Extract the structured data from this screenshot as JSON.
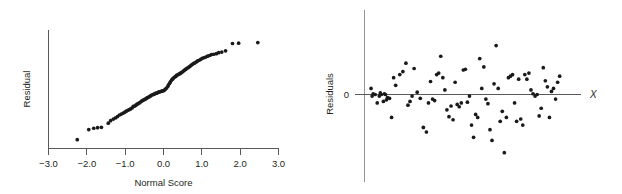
{
  "figure": {
    "panels": [
      {
        "id": "normal-probability-plot",
        "ylabel": "Residual",
        "xlabel": "Normal Score",
        "xticks": [
          "−3.0",
          "−2.0",
          "−1.0",
          "0.0",
          "1.0",
          "2.0",
          "3.0"
        ],
        "yticks": []
      },
      {
        "id": "residual-plot",
        "ylabel": "Residuals",
        "xlabel": "X",
        "xticks": [],
        "yticks": [
          "0"
        ]
      }
    ]
  },
  "chart_data": [
    {
      "type": "scatter",
      "id": "normal-probability-plot",
      "title": "",
      "xlabel": "Normal Score",
      "ylabel": "Residual",
      "xlim": [
        -3.0,
        3.0
      ],
      "ylim": [
        -1.0,
        1.0
      ],
      "xticks": [
        -3.0,
        -2.0,
        -1.0,
        0.0,
        1.0,
        2.0,
        3.0
      ],
      "xticklabels": [
        "−3.0",
        "−2.0",
        "−1.0",
        "0.0",
        "1.0",
        "2.0",
        "3.0"
      ],
      "yticks": [],
      "grid": false,
      "legend": null,
      "series": [
        {
          "name": "residual quantiles",
          "x": [
            -2.25,
            -1.95,
            -1.82,
            -1.72,
            -1.62,
            -1.44,
            -1.38,
            -1.31,
            -1.25,
            -1.2,
            -1.15,
            -1.1,
            -1.05,
            -1.01,
            -0.97,
            -0.93,
            -0.89,
            -0.86,
            -0.82,
            -0.79,
            -0.75,
            -0.72,
            -0.69,
            -0.66,
            -0.63,
            -0.6,
            -0.57,
            -0.54,
            -0.51,
            -0.48,
            -0.45,
            -0.43,
            -0.4,
            -0.37,
            -0.34,
            -0.32,
            -0.29,
            -0.26,
            -0.24,
            -0.21,
            -0.18,
            -0.16,
            -0.13,
            -0.11,
            -0.08,
            -0.05,
            -0.03,
            0.0,
            0.03,
            0.05,
            0.08,
            0.11,
            0.13,
            0.16,
            0.18,
            0.21,
            0.24,
            0.26,
            0.29,
            0.32,
            0.34,
            0.37,
            0.4,
            0.43,
            0.45,
            0.48,
            0.51,
            0.54,
            0.57,
            0.6,
            0.63,
            0.66,
            0.69,
            0.72,
            0.75,
            0.79,
            0.82,
            0.86,
            0.89,
            0.93,
            0.97,
            1.01,
            1.05,
            1.1,
            1.15,
            1.2,
            1.25,
            1.31,
            1.38,
            1.44,
            1.52,
            1.62,
            1.8,
            1.96,
            2.46
          ],
          "y": [
            -0.86,
            -0.7,
            -0.68,
            -0.67,
            -0.665,
            -0.6,
            -0.56,
            -0.535,
            -0.515,
            -0.495,
            -0.47,
            -0.455,
            -0.44,
            -0.425,
            -0.41,
            -0.395,
            -0.385,
            -0.375,
            -0.36,
            -0.335,
            -0.33,
            -0.315,
            -0.3,
            -0.29,
            -0.28,
            -0.265,
            -0.25,
            -0.24,
            -0.23,
            -0.22,
            -0.21,
            -0.2,
            -0.19,
            -0.18,
            -0.17,
            -0.16,
            -0.15,
            -0.145,
            -0.14,
            -0.13,
            -0.125,
            -0.12,
            -0.11,
            -0.105,
            -0.1,
            -0.095,
            -0.09,
            -0.085,
            -0.075,
            -0.06,
            -0.045,
            -0.02,
            0.005,
            0.03,
            0.055,
            0.08,
            0.1,
            0.115,
            0.13,
            0.14,
            0.155,
            0.165,
            0.175,
            0.185,
            0.195,
            0.205,
            0.22,
            0.235,
            0.25,
            0.26,
            0.275,
            0.285,
            0.3,
            0.315,
            0.33,
            0.345,
            0.355,
            0.37,
            0.385,
            0.395,
            0.41,
            0.425,
            0.435,
            0.445,
            0.46,
            0.47,
            0.485,
            0.49,
            0.5,
            0.515,
            0.525,
            0.545,
            0.66,
            0.665,
            0.675
          ]
        }
      ]
    },
    {
      "type": "scatter",
      "id": "residual-plot",
      "title": "",
      "xlabel": "X",
      "ylabel": "Residuals",
      "xlim": [
        0,
        100
      ],
      "ylim": [
        -1.0,
        1.0
      ],
      "xticks": [],
      "yticks": [
        0
      ],
      "yticklabels": [
        "0"
      ],
      "grid": false,
      "legend": null,
      "reference_line": 0,
      "series": [
        {
          "name": "residuals vs X",
          "x": [
            1.5,
            2.0,
            2.5,
            3.5,
            4.5,
            5.5,
            6.0,
            6.5,
            7.5,
            8.0,
            8.5,
            9.0,
            9.5,
            10.5,
            11.5,
            12.5,
            13.5,
            15.5,
            17.0,
            18.5,
            19.5,
            20.5,
            21.5,
            22.5,
            24.0,
            25.5,
            27.0,
            28.5,
            29.5,
            30.5,
            31.5,
            32.5,
            33.5,
            34.5,
            35.5,
            36.5,
            37.5,
            38.5,
            39.5,
            40.5,
            41.5,
            42.5,
            43.5,
            44.5,
            45.5,
            46.5,
            47.5,
            48.5,
            49.5,
            50.5,
            51.5,
            52.5,
            53.5,
            54.5,
            55.5,
            56.5,
            57.5,
            58.5,
            59.5,
            60.5,
            61.5,
            62.5,
            63.5,
            64.5,
            65.5,
            66.5,
            67.5,
            68.5,
            69.5,
            70.5,
            71.5,
            72.5,
            73.5,
            74.5,
            75.5,
            76.5,
            77.5,
            78.5,
            79.5,
            80.5,
            81.5,
            82.5,
            83.5,
            84.5,
            85.5,
            86.5,
            87.5,
            88.5,
            89.5,
            90.5,
            91.5,
            92.5,
            93.5
          ],
          "y": [
            0.08,
            -0.02,
            0.01,
            0.0,
            -0.11,
            -0.02,
            0.02,
            0.0,
            -0.09,
            0.01,
            0.0,
            -0.07,
            -0.04,
            -0.05,
            -0.3,
            0.22,
            0.12,
            0.26,
            0.3,
            0.41,
            -0.14,
            -0.09,
            -0.02,
            0.34,
            0.03,
            -0.05,
            -0.43,
            -0.49,
            -0.11,
            0.17,
            -0.06,
            -0.08,
            0.26,
            0.28,
            0.5,
            0.22,
            0.06,
            -0.2,
            -0.29,
            -0.15,
            -0.33,
            0.16,
            -0.13,
            -0.16,
            -0.11,
            0.32,
            0.33,
            -0.1,
            -0.02,
            -0.4,
            -0.56,
            -0.26,
            -0.3,
            0.47,
            0.08,
            0.36,
            -0.06,
            -0.12,
            -0.46,
            -0.6,
            0.14,
            0.64,
            0.08,
            -0.35,
            -0.22,
            -0.76,
            -0.3,
            0.22,
            0.24,
            0.26,
            -0.11,
            -0.35,
            0.2,
            -0.32,
            -0.4,
            0.26,
            0.2,
            0.28,
            0.06,
            0.01,
            -0.02,
            0.0,
            -0.28,
            -0.18,
            0.35,
            0.18,
            0.1,
            -0.3,
            0.04,
            0.08,
            -0.06,
            0.16,
            0.24
          ]
        }
      ]
    }
  ]
}
